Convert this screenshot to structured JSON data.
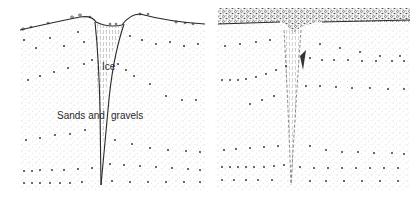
{
  "figure": {
    "panels": [
      {
        "id": "left",
        "description": "Active ice wedge in sands and gravels",
        "labels": {
          "ice": "Ice",
          "sediment_part1": "Sands and",
          "sediment_part2": "gravels"
        }
      },
      {
        "id": "right",
        "description": "Ice-wedge cast (pseudomorph) beneath coarse surface gravel layer",
        "labels": {}
      }
    ],
    "colors": {
      "ink": "#2a2a2a",
      "stipple": "#8a8a8a",
      "background": "#ffffff"
    }
  }
}
